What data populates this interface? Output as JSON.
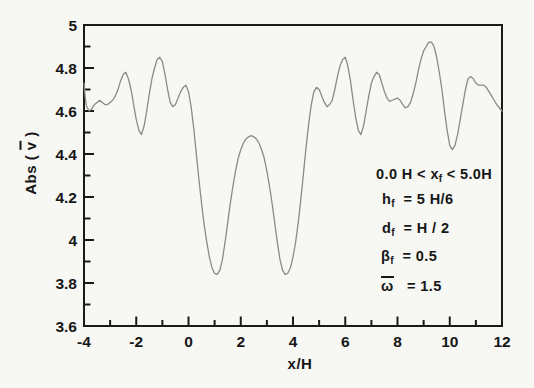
{
  "axis_titles": {
    "y_pre": "Abs ( ",
    "y_bar": "v",
    "y_post": " )",
    "x": "x/H"
  },
  "annotations": {
    "lines": [
      {
        "pre": "0.0 H < x",
        "sub": "f",
        "post": " < 5.0H",
        "bar": false
      },
      {
        "pre": "h",
        "sub": "f",
        "post": "  = 5 H/6",
        "bar": false
      },
      {
        "pre": "d",
        "sub": "f",
        "post": "  = H / 2",
        "bar": false
      },
      {
        "pre": "β",
        "sub": "f",
        "post": "  = 0.5",
        "bar": false
      },
      {
        "pre": "ω",
        "sub": "",
        "post": "   = 1.5",
        "bar": true
      }
    ]
  },
  "chart_data": {
    "type": "line",
    "title": "",
    "xlabel": "x/H",
    "ylabel": "Abs ( v̄ )",
    "xlim": [
      -4,
      12
    ],
    "ylim": [
      3.6,
      5.0
    ],
    "grid": false,
    "legend": null,
    "x_major_ticks": [
      -4,
      -2,
      0,
      2,
      4,
      6,
      8,
      10,
      12
    ],
    "x_tick_labels": [
      "-4",
      "-2",
      "0",
      "2",
      "4",
      "6",
      "8",
      "10",
      "12"
    ],
    "x_minor_step": 1,
    "y_major_ticks": [
      5,
      4.8,
      4.6,
      4.4,
      4.2,
      4,
      3.8,
      3.6
    ],
    "y_tick_labels": [
      "5",
      "4.8",
      "4.6",
      "4.4",
      "4.2",
      "4",
      "3.8",
      "3.6"
    ],
    "y_minor_step": 0.1,
    "colors": {
      "curve": "#8a8a8a",
      "axis": "#1a1a1a",
      "text": "#161616",
      "background": "#f7f7f4"
    },
    "series": [
      {
        "name": "Abs(v̄)",
        "points": [
          [
            -4,
            4.73
          ],
          [
            -3.95,
            4.66
          ],
          [
            -3.9,
            4.62
          ],
          [
            -3.8,
            4.6
          ],
          [
            -3.7,
            4.61
          ],
          [
            -3.6,
            4.63
          ],
          [
            -3.5,
            4.64
          ],
          [
            -3.4,
            4.65
          ],
          [
            -3.3,
            4.64
          ],
          [
            -3.2,
            4.63
          ],
          [
            -3.1,
            4.63
          ],
          [
            -3,
            4.64
          ],
          [
            -2.9,
            4.65
          ],
          [
            -2.8,
            4.67
          ],
          [
            -2.7,
            4.7
          ],
          [
            -2.6,
            4.74
          ],
          [
            -2.5,
            4.77
          ],
          [
            -2.4,
            4.78
          ],
          [
            -2.3,
            4.75
          ],
          [
            -2.2,
            4.7
          ],
          [
            -2.1,
            4.63
          ],
          [
            -2,
            4.56
          ],
          [
            -1.9,
            4.51
          ],
          [
            -1.8,
            4.49
          ],
          [
            -1.7,
            4.53
          ],
          [
            -1.6,
            4.6
          ],
          [
            -1.5,
            4.68
          ],
          [
            -1.4,
            4.75
          ],
          [
            -1.3,
            4.8
          ],
          [
            -1.2,
            4.84
          ],
          [
            -1.1,
            4.85
          ],
          [
            -1,
            4.83
          ],
          [
            -0.9,
            4.77
          ],
          [
            -0.8,
            4.7
          ],
          [
            -0.7,
            4.64
          ],
          [
            -0.6,
            4.62
          ],
          [
            -0.5,
            4.63
          ],
          [
            -0.4,
            4.66
          ],
          [
            -0.3,
            4.69
          ],
          [
            -0.2,
            4.71
          ],
          [
            -0.1,
            4.72
          ],
          [
            0,
            4.69
          ],
          [
            0.1,
            4.62
          ],
          [
            0.2,
            4.52
          ],
          [
            0.3,
            4.4
          ],
          [
            0.4,
            4.28
          ],
          [
            0.5,
            4.17
          ],
          [
            0.6,
            4.07
          ],
          [
            0.7,
            3.99
          ],
          [
            0.8,
            3.92
          ],
          [
            0.9,
            3.87
          ],
          [
            1,
            3.845
          ],
          [
            1.1,
            3.84
          ],
          [
            1.2,
            3.86
          ],
          [
            1.3,
            3.91
          ],
          [
            1.4,
            3.99
          ],
          [
            1.5,
            4.08
          ],
          [
            1.6,
            4.17
          ],
          [
            1.7,
            4.25
          ],
          [
            1.8,
            4.32
          ],
          [
            1.9,
            4.38
          ],
          [
            2,
            4.42
          ],
          [
            2.1,
            4.45
          ],
          [
            2.2,
            4.47
          ],
          [
            2.3,
            4.48
          ],
          [
            2.4,
            4.485
          ],
          [
            2.5,
            4.48
          ],
          [
            2.6,
            4.47
          ],
          [
            2.7,
            4.45
          ],
          [
            2.8,
            4.42
          ],
          [
            2.9,
            4.38
          ],
          [
            3,
            4.32
          ],
          [
            3.1,
            4.25
          ],
          [
            3.2,
            4.17
          ],
          [
            3.3,
            4.08
          ],
          [
            3.4,
            3.99
          ],
          [
            3.5,
            3.91
          ],
          [
            3.6,
            3.86
          ],
          [
            3.7,
            3.84
          ],
          [
            3.8,
            3.845
          ],
          [
            3.9,
            3.87
          ],
          [
            4,
            3.92
          ],
          [
            4.1,
            3.99
          ],
          [
            4.2,
            4.08
          ],
          [
            4.3,
            4.19
          ],
          [
            4.4,
            4.31
          ],
          [
            4.5,
            4.43
          ],
          [
            4.6,
            4.54
          ],
          [
            4.7,
            4.63
          ],
          [
            4.8,
            4.69
          ],
          [
            4.9,
            4.71
          ],
          [
            5,
            4.7
          ],
          [
            5.1,
            4.67
          ],
          [
            5.2,
            4.64
          ],
          [
            5.3,
            4.62
          ],
          [
            5.4,
            4.63
          ],
          [
            5.5,
            4.65
          ],
          [
            5.6,
            4.7
          ],
          [
            5.7,
            4.76
          ],
          [
            5.8,
            4.81
          ],
          [
            5.9,
            4.84
          ],
          [
            6,
            4.85
          ],
          [
            6.1,
            4.81
          ],
          [
            6.2,
            4.74
          ],
          [
            6.3,
            4.65
          ],
          [
            6.4,
            4.57
          ],
          [
            6.5,
            4.51
          ],
          [
            6.6,
            4.49
          ],
          [
            6.7,
            4.53
          ],
          [
            6.8,
            4.6
          ],
          [
            6.9,
            4.67
          ],
          [
            7,
            4.73
          ],
          [
            7.1,
            4.76
          ],
          [
            7.2,
            4.78
          ],
          [
            7.3,
            4.77
          ],
          [
            7.4,
            4.73
          ],
          [
            7.5,
            4.69
          ],
          [
            7.6,
            4.66
          ],
          [
            7.7,
            4.645
          ],
          [
            7.8,
            4.65
          ],
          [
            7.9,
            4.655
          ],
          [
            8,
            4.66
          ],
          [
            8.1,
            4.65
          ],
          [
            8.2,
            4.63
          ],
          [
            8.3,
            4.615
          ],
          [
            8.4,
            4.62
          ],
          [
            8.5,
            4.64
          ],
          [
            8.6,
            4.68
          ],
          [
            8.7,
            4.73
          ],
          [
            8.8,
            4.79
          ],
          [
            8.9,
            4.84
          ],
          [
            9,
            4.88
          ],
          [
            9.1,
            4.9
          ],
          [
            9.2,
            4.92
          ],
          [
            9.3,
            4.92
          ],
          [
            9.4,
            4.9
          ],
          [
            9.5,
            4.85
          ],
          [
            9.6,
            4.78
          ],
          [
            9.7,
            4.7
          ],
          [
            9.8,
            4.6
          ],
          [
            9.9,
            4.51
          ],
          [
            10,
            4.44
          ],
          [
            10.1,
            4.42
          ],
          [
            10.2,
            4.44
          ],
          [
            10.3,
            4.49
          ],
          [
            10.4,
            4.56
          ],
          [
            10.5,
            4.63
          ],
          [
            10.6,
            4.7
          ],
          [
            10.7,
            4.75
          ],
          [
            10.8,
            4.76
          ],
          [
            10.9,
            4.75
          ],
          [
            11,
            4.73
          ],
          [
            11.1,
            4.72
          ],
          [
            11.2,
            4.72
          ],
          [
            11.3,
            4.72
          ],
          [
            11.4,
            4.71
          ],
          [
            11.5,
            4.69
          ],
          [
            11.6,
            4.67
          ],
          [
            11.7,
            4.65
          ],
          [
            11.8,
            4.63
          ],
          [
            11.9,
            4.615
          ],
          [
            12,
            4.6
          ]
        ]
      }
    ]
  }
}
